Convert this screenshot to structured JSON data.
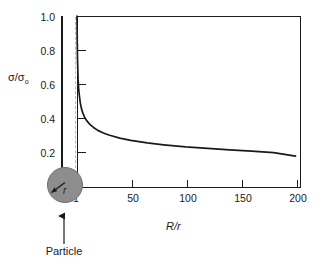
{
  "figure": {
    "background_color": "#ffffff",
    "line_color": "#1a1a1a",
    "particle_fill": "#8d8d8d",
    "guide_color": "#b9b9b9"
  },
  "annotations": {
    "particle_label": "Particle",
    "radius_label": "r"
  },
  "chart_data": {
    "type": "line",
    "title": "",
    "subtitle": "",
    "xlabel": "R/r",
    "ylabel": "σ/σ₀",
    "xlabel_parts": {
      "numerator": "R",
      "separator": "/",
      "denominator": "r"
    },
    "ylabel_parts": {
      "numerator": "σ",
      "separator": "/",
      "denominator": "σ",
      "subscript": "o"
    },
    "xlim": [
      1,
      205
    ],
    "ylim": [
      0,
      1.0
    ],
    "xticks": [
      1,
      50,
      100,
      150,
      200
    ],
    "xticklabels": [
      "1",
      "50",
      "100",
      "150",
      "200"
    ],
    "yticks": [
      0.2,
      0.4,
      0.6,
      0.8,
      1.0
    ],
    "yticklabels": [
      "0.2",
      "0.4",
      "0.6",
      "0.8",
      "1.0"
    ],
    "grid": false,
    "legend": null,
    "series": [
      {
        "name": "stress ratio",
        "x": [
          1,
          1.2,
          1.5,
          2,
          2.5,
          3,
          4,
          5,
          6,
          8,
          10,
          13,
          16,
          20,
          25,
          30,
          40,
          50,
          65,
          80,
          100,
          120,
          140,
          160,
          180,
          200
        ],
        "y": [
          1.0,
          0.86,
          0.74,
          0.63,
          0.58,
          0.545,
          0.495,
          0.463,
          0.441,
          0.41,
          0.39,
          0.368,
          0.352,
          0.335,
          0.32,
          0.308,
          0.29,
          0.277,
          0.262,
          0.251,
          0.239,
          0.23,
          0.222,
          0.214,
          0.206,
          0.185
        ]
      }
    ],
    "annotations": [
      {
        "kind": "vline",
        "x": 1,
        "style": "dashed",
        "note": "particle surface reference"
      },
      {
        "kind": "circle-marker",
        "label": "Particle",
        "radius_label": "r"
      }
    ]
  }
}
